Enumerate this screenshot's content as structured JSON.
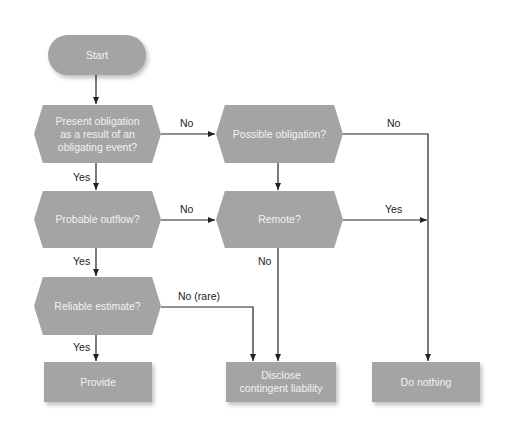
{
  "diagram": {
    "colors": {
      "node_fill": "#a4a4a4",
      "node_text": "#f2f2f2",
      "line": "#222222",
      "background": "#ffffff"
    },
    "nodes": {
      "start": {
        "label": "Start",
        "shape": "terminal"
      },
      "present_obligation": {
        "label": "Present obligation as a result of an obligating event?",
        "line1": "Present obligation",
        "line2": "as a result of an",
        "line3": "obligating event?",
        "shape": "decision"
      },
      "possible_obligation": {
        "label": "Possible obligation?",
        "shape": "decision"
      },
      "probable_outflow": {
        "label": "Probable outflow?",
        "shape": "decision"
      },
      "remote": {
        "label": "Remote?",
        "shape": "decision"
      },
      "reliable_estimate": {
        "label": "Reliable estimate?",
        "shape": "decision"
      },
      "provide": {
        "label": "Provide",
        "shape": "process"
      },
      "disclose": {
        "label": "Disclose contingent liability",
        "line1": "Disclose",
        "line2": "contingent liability",
        "shape": "process"
      },
      "do_nothing": {
        "label": "Do nothing",
        "shape": "process"
      }
    },
    "edges": [
      {
        "from": "start",
        "to": "present_obligation",
        "label": ""
      },
      {
        "from": "present_obligation",
        "to": "possible_obligation",
        "label": "No"
      },
      {
        "from": "present_obligation",
        "to": "probable_outflow",
        "label": "Yes"
      },
      {
        "from": "possible_obligation",
        "to": "do_nothing",
        "label": "No"
      },
      {
        "from": "possible_obligation",
        "to": "remote",
        "label": ""
      },
      {
        "from": "probable_outflow",
        "to": "remote",
        "label": "No"
      },
      {
        "from": "probable_outflow",
        "to": "reliable_estimate",
        "label": "Yes"
      },
      {
        "from": "remote",
        "to": "do_nothing",
        "label": "Yes"
      },
      {
        "from": "remote",
        "to": "disclose",
        "label": "No"
      },
      {
        "from": "reliable_estimate",
        "to": "disclose",
        "label": "No (rare)"
      },
      {
        "from": "reliable_estimate",
        "to": "provide",
        "label": "Yes"
      }
    ],
    "edge_labels": {
      "present_no": "No",
      "present_yes": "Yes",
      "possible_no": "No",
      "probable_no": "No",
      "probable_yes": "Yes",
      "remote_yes": "Yes",
      "remote_no": "No",
      "reliable_no": "No (rare)",
      "reliable_yes": "Yes"
    }
  }
}
